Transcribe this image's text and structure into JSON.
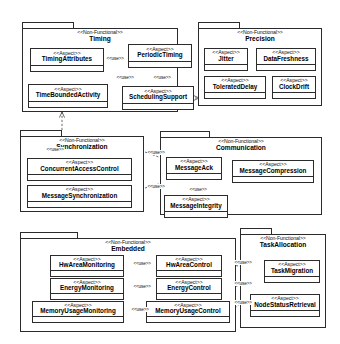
{
  "diagram": {
    "type": "uml-package-diagram",
    "stereotype_package": "<<Non-Functional>>",
    "stereotype_aspect": "<<Aspect>>",
    "dependency_label": "<<use>>",
    "packages": [
      {
        "id": "timing",
        "name": "Timing",
        "stereotype": "<<Non-Functional>>",
        "aspects": [
          {
            "id": "timing-attributes",
            "name": "TimingAttributes",
            "stereotype": "<<Aspect>>"
          },
          {
            "id": "periodic-timing",
            "name": "PeriodicTiming",
            "stereotype": "<<Aspect>>"
          },
          {
            "id": "time-bounded-activity",
            "name": "TimeBoundedActivity",
            "stereotype": "<<Aspect>>"
          },
          {
            "id": "scheduling-support",
            "name": "SchedulingSupport",
            "stereotype": "<<Aspect>>"
          }
        ]
      },
      {
        "id": "precision",
        "name": "Precision",
        "stereotype": "<<Non-Functional>>",
        "aspects": [
          {
            "id": "jitter",
            "name": "Jitter",
            "stereotype": "<<Aspect>>"
          },
          {
            "id": "data-freshness",
            "name": "DataFreshness",
            "stereotype": "<<Aspect>>"
          },
          {
            "id": "tolerated-delay",
            "name": "ToleratedDelay",
            "stereotype": "<<Aspect>>"
          },
          {
            "id": "clock-drift",
            "name": "ClockDrift",
            "stereotype": "<<Aspect>>"
          }
        ]
      },
      {
        "id": "synchronization",
        "name": "Synchronization",
        "stereotype": "<<Non-Functional>>",
        "aspects": [
          {
            "id": "concurrent-access-control",
            "name": "ConcurrentAccessControl",
            "stereotype": "<<Aspect>>"
          },
          {
            "id": "message-synchronization",
            "name": "MessageSynchronization",
            "stereotype": "<<Aspect>>"
          }
        ]
      },
      {
        "id": "communication",
        "name": "Communication",
        "stereotype": "<<Non-Functional>>",
        "aspects": [
          {
            "id": "message-ack",
            "name": "MessageAck",
            "stereotype": "<<Aspect>>"
          },
          {
            "id": "message-compression",
            "name": "MessageCompression",
            "stereotype": "<<Aspect>>"
          },
          {
            "id": "message-integrity",
            "name": "MessageIntegrity",
            "stereotype": "<<Aspect>>"
          }
        ]
      },
      {
        "id": "embedded",
        "name": "Embedded",
        "stereotype": "<<Non-Functional>>",
        "aspects": [
          {
            "id": "hw-area-monitoring",
            "name": "HwAreaMonitoring",
            "stereotype": "<<Aspect>>"
          },
          {
            "id": "hw-area-control",
            "name": "HwAreaControl",
            "stereotype": "<<Aspect>>"
          },
          {
            "id": "energy-monitoring",
            "name": "EnergyMonitoring",
            "stereotype": "<<Aspect>>"
          },
          {
            "id": "energy-control",
            "name": "EnergyControl",
            "stereotype": "<<Aspect>>"
          },
          {
            "id": "memory-usage-monitoring",
            "name": "MemoryUsageMonitoring",
            "stereotype": "<<Aspect>>"
          },
          {
            "id": "memory-usage-control",
            "name": "MemoryUsageControl",
            "stereotype": "<<Aspect>>"
          }
        ]
      },
      {
        "id": "task-allocation",
        "name": "TaskAllocation",
        "stereotype": "<<Non-Functional>>",
        "aspects": [
          {
            "id": "task-migration",
            "name": "TaskMigration",
            "stereotype": "<<Aspect>>"
          },
          {
            "id": "node-status-retrieval",
            "name": "NodeStatusRetrieval",
            "stereotype": "<<Aspect>>"
          }
        ]
      }
    ],
    "dependencies": [
      {
        "from": "timing-attributes",
        "to": "periodic-timing",
        "label": "<<use>>"
      },
      {
        "from": "timing-attributes",
        "to": "scheduling-support",
        "label": "<<use>>"
      },
      {
        "from": "periodic-timing",
        "to": "scheduling-support",
        "label": "<<use>>"
      },
      {
        "from": "time-bounded-activity",
        "to": "timing-attributes",
        "label": "<<use>>"
      },
      {
        "from": "scheduling-support",
        "to": "precision",
        "label": "<<use>>"
      },
      {
        "from": "synchronization",
        "to": "timing",
        "label": "<<use>>"
      },
      {
        "from": "concurrent-access-control",
        "to": "message-ack",
        "label": "<<use>>"
      },
      {
        "from": "message-synchronization",
        "to": "message-ack",
        "label": "<<use>>"
      },
      {
        "from": "message-ack",
        "to": "message-integrity",
        "label": "<<use>>"
      },
      {
        "from": "hw-area-monitoring",
        "to": "hw-area-control",
        "label": "<<use>>"
      },
      {
        "from": "energy-control",
        "to": "energy-monitoring",
        "label": "<<use>>"
      },
      {
        "from": "memory-usage-monitoring",
        "to": "memory-usage-control",
        "label": "<<use>>"
      },
      {
        "from": "hw-area-control",
        "to": "task-migration",
        "label": "<<use>>"
      },
      {
        "from": "energy-control",
        "to": "task-migration",
        "label": "<<use>>"
      },
      {
        "from": "memory-usage-control",
        "to": "task-migration",
        "label": "<<use>>"
      }
    ],
    "colors": {
      "stroke": "#2b2b2b",
      "fill": "#ffffff",
      "text": "#000000",
      "background": "#ffffff"
    }
  }
}
